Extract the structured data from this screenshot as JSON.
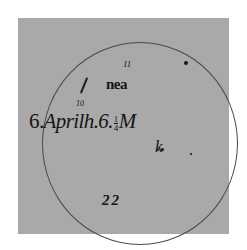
{
  "figure": {
    "main_label": {
      "day": "6.",
      "month": "April",
      "hour_prefix": "h.6.",
      "fraction_numerator": "1",
      "fraction_denominator": "4",
      "suffix": "M"
    },
    "annotations": {
      "number_11": "11",
      "number_10": "10",
      "spot_group_label": "nea",
      "spot_k_label": "k",
      "page_number": "22"
    },
    "colors": {
      "background": "#ffffff",
      "panel": "#a9a9a9",
      "ink": "#151515",
      "disk_outline": "#4a4a4a"
    }
  }
}
